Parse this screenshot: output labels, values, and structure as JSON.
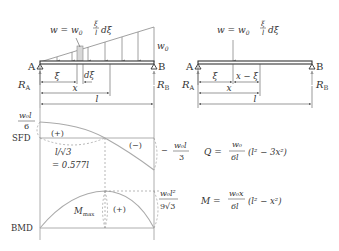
{
  "left_diagram": {
    "load_label_lhs": "w = w",
    "load_label_sub": "0",
    "load_frac_num": "ξ",
    "load_frac_den": "l",
    "load_label_tail": "dξ",
    "max_load_label": "w",
    "max_load_sub": "0",
    "support_a": "A",
    "support_b": "B",
    "reaction_a": "R",
    "reaction_a_sub": "A",
    "reaction_b": "R",
    "reaction_b_sub": "B",
    "dim_xi": "ξ",
    "dim_dxi": "dξ",
    "dim_x": "x",
    "dim_l": "l"
  },
  "right_diagram": {
    "load_label_lhs": "w = w",
    "load_label_sub": "0",
    "load_frac_num": "ξ",
    "load_frac_den": "l",
    "load_label_tail": "dξ",
    "support_a": "A",
    "support_b": "B",
    "reaction_a": "R",
    "reaction_a_sub": "A",
    "reaction_b": "R",
    "reaction_b_sub": "B",
    "dim_xi": "ξ",
    "dim_x_minus_xi": "x − ξ",
    "dim_x": "x",
    "dim_l": "l"
  },
  "sfd": {
    "label": "SFD",
    "max_value_num": "w₀l",
    "max_value_den": "6",
    "positive_sign": "(+)",
    "negative_sign": "(−)",
    "zero_location_top": "l/√3",
    "zero_location_bottom": "= 0.577l",
    "end_value_prefix": "−",
    "end_value_num": "w₀l",
    "end_value_den": "3",
    "equation_lhs": "Q =",
    "equation_num": "w₀",
    "equation_den": "6l",
    "equation_rhs": "(l² − 3x²)"
  },
  "bmd": {
    "label": "BMD",
    "max_label": "M",
    "max_label_sub": "max",
    "positive_sign": "(+)",
    "max_value_num": "w₀l²",
    "max_value_den": "9√3",
    "equation_lhs": "M =",
    "equation_num": "w₀x",
    "equation_den": "6l",
    "equation_rhs": "(l² − x²)"
  },
  "colors": {
    "ink": "#333333",
    "curve": "#aaaaaa",
    "guide": "#999999",
    "element_fill": "#d8d8d8"
  }
}
